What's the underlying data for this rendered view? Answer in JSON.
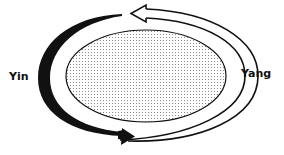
{
  "diagram": {
    "labels": {
      "yin": "Yin",
      "yang": "Yang"
    },
    "elements": {
      "center": "stippled-ellipse",
      "yin_arrow": "solid-black-curved-arrow (left side, top to bottom, pointing right)",
      "yang_arrow": "hollow-outline-curved-arrow (right side, bottom to top, pointing left)"
    },
    "colors": {
      "ink": "#111111",
      "background": "#ffffff",
      "stipple": "#9a9a9a"
    }
  }
}
